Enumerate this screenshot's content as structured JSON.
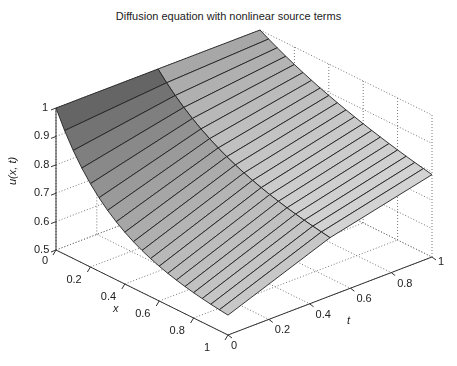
{
  "chart_data": {
    "type": "surface3d",
    "title": "Diffusion equation with nonlinear source terms",
    "xlabel": "x",
    "ylabel": "t",
    "zlabel": "u(x, t)",
    "xlim": [
      0,
      1
    ],
    "ylim": [
      0,
      1
    ],
    "zlim": [
      0.5,
      1
    ],
    "x_ticks": [
      "0",
      "0.2",
      "0.4",
      "0.6",
      "0.8",
      "1"
    ],
    "t_ticks": [
      "0",
      "0.2",
      "0.4",
      "0.6",
      "0.8",
      "1"
    ],
    "z_ticks": [
      "0.5",
      "0.6",
      "0.7",
      "0.8",
      "0.9",
      "1"
    ],
    "grid": true,
    "colormap": "gray",
    "x": [
      0,
      0.05,
      0.1,
      0.15,
      0.2,
      0.25,
      0.3,
      0.35,
      0.4,
      0.45,
      0.5,
      0.55,
      0.6,
      0.65,
      0.7,
      0.75,
      0.8,
      0.85,
      0.9,
      0.95,
      1
    ],
    "t": [
      0,
      0.5,
      1
    ],
    "u_description": "u(0,t)=1 along the x=0 edge; at t=0 the profile drops steeply to about 0.57 at x=1; at larger t the surface flattens toward ~0.75-0.8 near x=1"
  },
  "labels": {
    "title": "Diffusion equation with nonlinear source terms",
    "zlabel": "u(x, t)",
    "xlabel": "x",
    "tlabel": "t"
  }
}
